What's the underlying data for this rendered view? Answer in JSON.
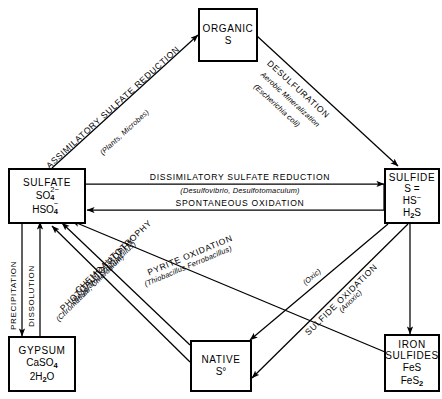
{
  "diagram": {
    "type": "cycle-diagram",
    "colors": {
      "stroke": "#000000",
      "background": "#ffffff"
    }
  },
  "nodes": {
    "organic": {
      "title": "ORGANIC",
      "formula1": "S"
    },
    "sulfate": {
      "title": "SULFATE",
      "formula1": "SO",
      "formula1_sub": "4",
      "formula1_sup": "2−",
      "formula2": "HSO",
      "formula2_sub": "4",
      "formula2_sup": "−"
    },
    "sulfide": {
      "title": "SULFIDE",
      "formula1": "S =",
      "formula2": "HS",
      "formula2_sup": "−",
      "formula3": "H",
      "formula3_sub": "2",
      "formula3_tail": "S"
    },
    "gypsum": {
      "title": "GYPSUM",
      "formula1": "CaSO",
      "formula1_sub": "4",
      "formula2": "2H",
      "formula2_sub": "2",
      "formula2_tail": "O"
    },
    "native": {
      "title": "NATIVE",
      "formula1": "S°"
    },
    "ironsulfides": {
      "title_line1": "IRON",
      "title_line2": "SULFIDES",
      "formula1": "FeS",
      "formula2": "FeS",
      "formula2_sub": "2"
    }
  },
  "edges": {
    "assimilatory": {
      "caption": "ASSIMILATORY SULFATE REDUCTION",
      "organisms": "(Plants, Microbes)"
    },
    "desulfuration": {
      "caption": "DESULFURATION",
      "subcaption": "Aerobic Mineralization",
      "organisms": "(Escherichia coli)"
    },
    "dissimilatory": {
      "caption": "DISSIMILATORY SULFATE REDUCTION",
      "organisms": "(Desulfovibrio, Desulfotomaculum)"
    },
    "spontaneous": {
      "caption": "SPONTANEOUS OXIDATION"
    },
    "pyrite": {
      "caption": "PYRITE OXIDATION",
      "organisms": "(Thiobacillus Ferrobacillus)"
    },
    "chemoautotrophy": {
      "caption": "CHEMOAUTOTROPHY",
      "organisms": "(Beggiatoa, Thiobacillus)"
    },
    "photoautotrophy": {
      "caption": "PHOTOAUTOTROPHY",
      "organisms": "(Chromatium, Chlorobium)"
    },
    "sulfide_oxidation": {
      "caption": "SULFIDE OXIDATION",
      "condition_oxic": "(Oxic)",
      "condition_anoxic": "(Anoxic)"
    },
    "precipitation": {
      "caption": "PRECIPITATION"
    },
    "dissolution": {
      "caption": "DISSOLUTION"
    }
  }
}
